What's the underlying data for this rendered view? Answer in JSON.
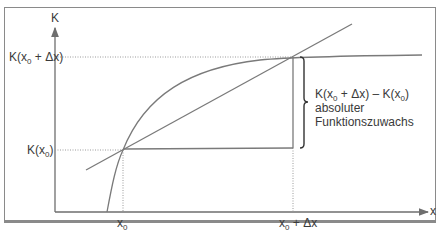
{
  "diagram": {
    "axes": {
      "y_label": "K",
      "x_label": "x"
    },
    "y_ticks": {
      "upper": {
        "prefix": "K(x",
        "sub": "0",
        "suffix": " + Δx)"
      },
      "lower": {
        "prefix": "K(x",
        "sub": "0",
        "suffix": ")"
      }
    },
    "x_ticks": {
      "left": {
        "prefix": "x",
        "sub": "0",
        "suffix": ""
      },
      "right": {
        "prefix": "x",
        "sub": "0",
        "suffix": " + Δx"
      }
    },
    "annotation": {
      "formula": {
        "p1": "K(x",
        "s1": "0",
        "p2": " + Δx) – K(x",
        "s2": "0",
        "p3": ")"
      },
      "line2": "absoluter",
      "line3": "Funktionszuwachs"
    },
    "elements": [
      "concave increasing function curve K(x)",
      "secant line through (x0, K(x0)) and (x0+Δx, K(x0+Δx))",
      "dotted guide lines to axes",
      "horizontal segment from (x0,K(x0)) to x0+Δx and vertical segment to K(x0+Δx)",
      "curly brace marking absolute increase"
    ],
    "colors": {
      "line": "#7a7a7a",
      "axis": "#6e6e6e",
      "text": "#3a3a3a"
    }
  }
}
